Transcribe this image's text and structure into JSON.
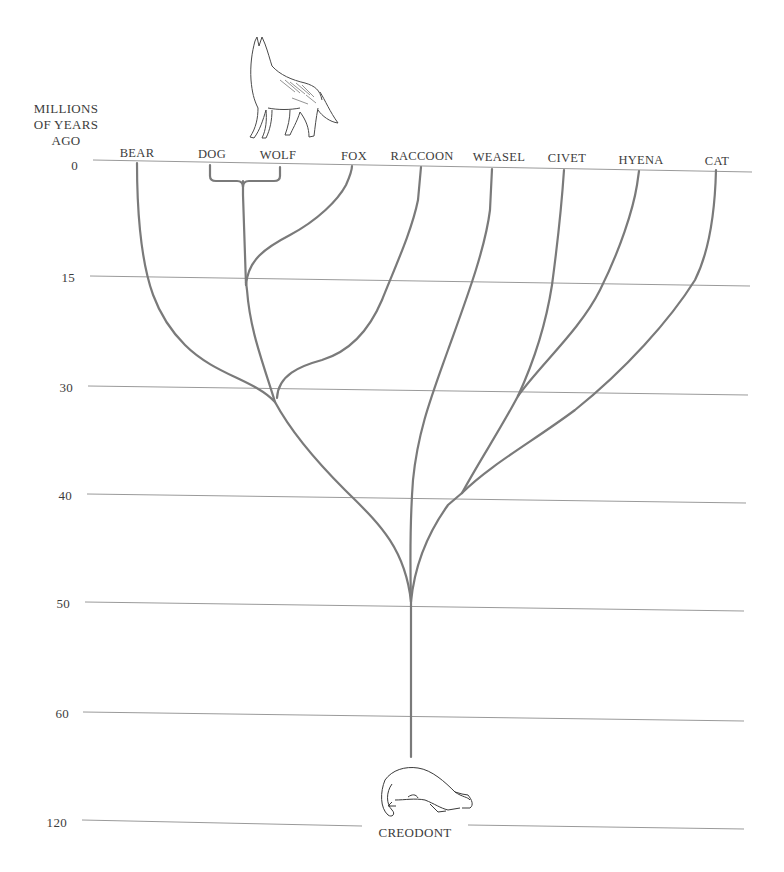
{
  "diagram": {
    "type": "phylogenetic-tree",
    "axis": {
      "title_lines": [
        "MILLIONS",
        "OF YEARS",
        "AGO"
      ],
      "ticks": [
        {
          "label": "0",
          "y": 167
        },
        {
          "label": "15",
          "y": 279
        },
        {
          "label": "30",
          "y": 389
        },
        {
          "label": "40",
          "y": 497
        },
        {
          "label": "50",
          "y": 605
        },
        {
          "label": "60",
          "y": 715
        },
        {
          "label": "120",
          "y": 824
        }
      ]
    },
    "taxa": [
      {
        "name": "BEAR",
        "x": 137
      },
      {
        "name": "DOG",
        "x": 212
      },
      {
        "name": "WOLF",
        "x": 278
      },
      {
        "name": "FOX",
        "x": 354
      },
      {
        "name": "RACCOON",
        "x": 422
      },
      {
        "name": "WEASEL",
        "x": 499
      },
      {
        "name": "CIVET",
        "x": 567
      },
      {
        "name": "HYENA",
        "x": 641
      },
      {
        "name": "CAT",
        "x": 717
      }
    ],
    "root": {
      "name": "CREODONT"
    },
    "illustrations": [
      "howling-wolf",
      "creodont"
    ],
    "branch_points_mya": {
      "dog_wolf_split": 0,
      "fox_from_dog_wolf": 15,
      "bear_canid_fox": 32,
      "civet_hyena": 31,
      "cat_from_civet_hyena": 40,
      "weasel_raccoon_from_root": 50,
      "all_from_creodont": 50
    },
    "colors": {
      "branch": "#7a7a7a",
      "gridline": "#9a9a9a",
      "text": "#3c3c3c",
      "background": "#ffffff"
    }
  }
}
